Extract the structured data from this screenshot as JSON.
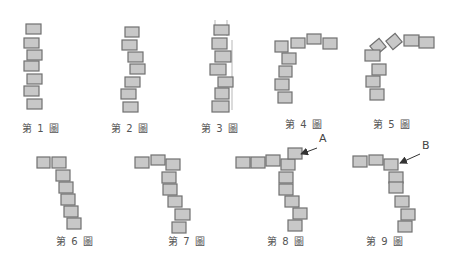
{
  "diagram": {
    "title": "",
    "block_fill": "#c8c8c8",
    "block_stroke": "#707070",
    "figures": [
      {
        "label": "第 1 圖",
        "label_pos": [
          41,
          128
        ],
        "blocks": [
          [
            26,
            24,
            15,
            10,
            0
          ],
          [
            24,
            38,
            15,
            10,
            0
          ],
          [
            27,
            50,
            15,
            10,
            0
          ],
          [
            24,
            61,
            15,
            10,
            0
          ],
          [
            27,
            74,
            15,
            10,
            0
          ],
          [
            24,
            86,
            15,
            10,
            0
          ],
          [
            27,
            99,
            15,
            10,
            0
          ]
        ]
      },
      {
        "label": "第 2 圖",
        "label_pos": [
          130,
          128
        ],
        "blocks": [
          [
            125,
            27,
            14,
            10,
            0
          ],
          [
            122,
            40,
            15,
            10,
            0
          ],
          [
            128,
            52,
            15,
            10,
            0
          ],
          [
            130,
            64,
            15,
            10,
            0
          ],
          [
            125,
            77,
            15,
            10,
            0
          ],
          [
            121,
            89,
            15,
            10,
            0
          ],
          [
            123,
            102,
            15,
            10,
            0
          ]
        ]
      },
      {
        "label": "第 3 圖",
        "label_pos": [
          220,
          128
        ],
        "blocks": [
          [
            214,
            25,
            15,
            10,
            0
          ],
          [
            212,
            38,
            15,
            11,
            0
          ],
          [
            215,
            51,
            16,
            11,
            0
          ],
          [
            210,
            64,
            16,
            11,
            0
          ],
          [
            218,
            77,
            15,
            10,
            0
          ],
          [
            215,
            88,
            14,
            11,
            0
          ],
          [
            212,
            101,
            17,
            11,
            0
          ]
        ],
        "guide_lines": [
          [
            215,
            20,
            215,
            36
          ],
          [
            227,
            20,
            227,
            36
          ],
          [
            232,
            40,
            232,
            110
          ]
        ]
      },
      {
        "label": "第 4 圖",
        "label_pos": [
          304,
          124
        ],
        "blocks": [
          [
            275,
            41,
            13,
            11,
            0
          ],
          [
            291,
            38,
            14,
            10,
            0
          ],
          [
            307,
            34,
            14,
            10,
            0
          ],
          [
            323,
            38,
            14,
            11,
            0
          ],
          [
            282,
            53,
            14,
            11,
            0
          ],
          [
            279,
            66,
            13,
            11,
            0
          ],
          [
            275,
            79,
            14,
            11,
            0
          ],
          [
            278,
            92,
            14,
            11,
            0
          ]
        ]
      },
      {
        "label": "第 5 圖",
        "label_pos": [
          392,
          124
        ],
        "blocks": [
          [
            372,
            41,
            12,
            11,
            -40
          ],
          [
            388,
            36,
            12,
            11,
            -40
          ],
          [
            404,
            35,
            15,
            11,
            0
          ],
          [
            419,
            37,
            15,
            11,
            0
          ],
          [
            365,
            50,
            15,
            11,
            0
          ],
          [
            372,
            64,
            14,
            11,
            0
          ],
          [
            366,
            76,
            14,
            11,
            0
          ],
          [
            370,
            89,
            14,
            11,
            0
          ]
        ]
      },
      {
        "label": "第 6 圖",
        "label_pos": [
          75,
          241
        ],
        "blocks": [
          [
            37,
            157,
            13,
            11,
            0
          ],
          [
            52,
            157,
            14,
            11,
            0
          ],
          [
            56,
            170,
            14,
            11,
            0
          ],
          [
            59,
            182,
            14,
            11,
            0
          ],
          [
            61,
            194,
            14,
            11,
            0
          ],
          [
            64,
            206,
            14,
            11,
            0
          ],
          [
            67,
            218,
            14,
            11,
            0
          ]
        ]
      },
      {
        "label": "第 7 圖",
        "label_pos": [
          187,
          241
        ],
        "blocks": [
          [
            135,
            157,
            14,
            11,
            0
          ],
          [
            151,
            155,
            14,
            10,
            0
          ],
          [
            166,
            159,
            14,
            11,
            0
          ],
          [
            162,
            172,
            14,
            11,
            0
          ],
          [
            163,
            184,
            14,
            11,
            0
          ],
          [
            168,
            196,
            14,
            11,
            0
          ],
          [
            175,
            209,
            15,
            11,
            0
          ],
          [
            172,
            222,
            14,
            11,
            0
          ]
        ]
      },
      {
        "label": "第 8 圖",
        "label_pos": [
          286,
          241
        ],
        "blocks": [
          [
            236,
            157,
            14,
            11,
            0
          ],
          [
            251,
            157,
            14,
            11,
            0
          ],
          [
            266,
            155,
            14,
            11,
            0
          ],
          [
            281,
            159,
            14,
            11,
            0
          ],
          [
            288,
            148,
            14,
            11,
            0
          ],
          [
            279,
            172,
            14,
            11,
            0
          ],
          [
            279,
            184,
            14,
            11,
            0
          ],
          [
            285,
            196,
            14,
            11,
            0
          ],
          [
            293,
            208,
            14,
            11,
            0
          ],
          [
            288,
            220,
            14,
            11,
            0
          ]
        ],
        "callout": {
          "text": "A",
          "text_pos": [
            319,
            140
          ],
          "arrow": [
            [
              317,
              148
            ],
            [
              301,
              154
            ]
          ]
        }
      },
      {
        "label": "第 9 圖",
        "label_pos": [
          385,
          241
        ],
        "blocks": [
          [
            353,
            156,
            14,
            11,
            0
          ],
          [
            369,
            155,
            14,
            10,
            0
          ],
          [
            384,
            159,
            14,
            11,
            0
          ],
          [
            389,
            172,
            14,
            11,
            0
          ],
          [
            389,
            182,
            14,
            11,
            0
          ],
          [
            395,
            196,
            14,
            11,
            0
          ],
          [
            401,
            209,
            14,
            11,
            0
          ],
          [
            398,
            221,
            14,
            11,
            0
          ]
        ],
        "callout": {
          "text": "B",
          "text_pos": [
            422,
            147
          ],
          "arrow": [
            [
              420,
              154
            ],
            [
              400,
              163
            ]
          ]
        }
      }
    ]
  }
}
